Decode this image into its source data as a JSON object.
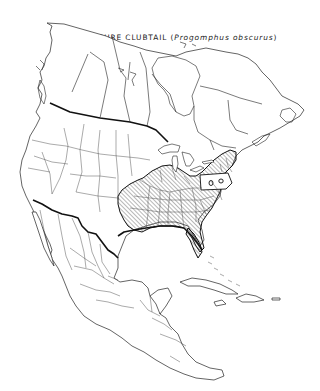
{
  "map": {
    "title_common": "OBSCURE CLUBTAIL",
    "title_open_paren": " (",
    "title_scientific": "Progomphus obscurus",
    "title_close_paren": ")",
    "region": "North America",
    "range_fill": "diagonal-hatch",
    "colors": {
      "background": "#ffffff",
      "line": "#222222",
      "hatch": "#333333"
    }
  }
}
